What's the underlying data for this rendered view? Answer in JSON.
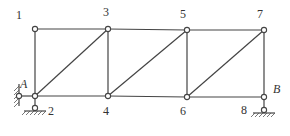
{
  "diagram": {
    "nodes": [
      {
        "id": "1",
        "label": "1",
        "x": 35,
        "y": 29,
        "lx": 16,
        "ly": 19
      },
      {
        "id": "2",
        "label": "2",
        "x": 35,
        "y": 96,
        "lx": 48,
        "ly": 115
      },
      {
        "id": "3",
        "label": "3",
        "x": 108,
        "y": 29,
        "lx": 103,
        "ly": 16
      },
      {
        "id": "4",
        "label": "4",
        "x": 108,
        "y": 96,
        "lx": 103,
        "ly": 115
      },
      {
        "id": "5",
        "label": "5",
        "x": 187,
        "y": 30,
        "lx": 180,
        "ly": 18
      },
      {
        "id": "6",
        "label": "6",
        "x": 187,
        "y": 97,
        "lx": 180,
        "ly": 115
      },
      {
        "id": "7",
        "label": "7",
        "x": 264,
        "y": 30,
        "lx": 257,
        "ly": 18
      },
      {
        "id": "8",
        "label": "8",
        "x": 264,
        "y": 97,
        "lx": 241,
        "ly": 114
      }
    ],
    "members": [
      [
        "1",
        "3"
      ],
      [
        "3",
        "5"
      ],
      [
        "5",
        "7"
      ],
      [
        "2",
        "4"
      ],
      [
        "4",
        "6"
      ],
      [
        "6",
        "8"
      ],
      [
        "1",
        "2"
      ],
      [
        "3",
        "4"
      ],
      [
        "5",
        "6"
      ],
      [
        "7",
        "8"
      ],
      [
        "2",
        "3"
      ],
      [
        "4",
        "5"
      ],
      [
        "6",
        "7"
      ]
    ],
    "supports": [
      {
        "label": "A",
        "type": "wall-link",
        "lx": 20,
        "ly": 87
      },
      {
        "label": "B",
        "type": "pin-ground",
        "lx": 274,
        "ly": 92
      }
    ],
    "labels": {
      "A": "A",
      "B": "B"
    }
  }
}
